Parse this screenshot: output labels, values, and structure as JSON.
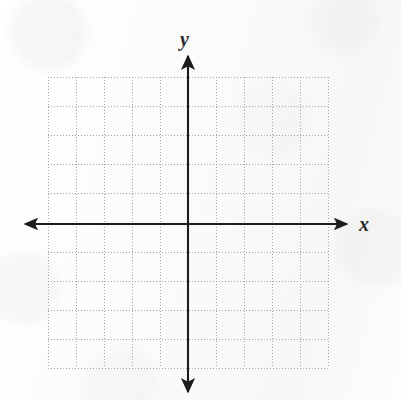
{
  "figure": {
    "background_color": "#fcfcfb"
  },
  "axes": {
    "x_label": "x",
    "y_label": "y",
    "axis_color": "#1c1c1c",
    "axis_line_width": 2,
    "x_axis": {
      "name": "x-axis",
      "y_position": 224,
      "start_x": 25,
      "end_x": 347,
      "arrowheads": [
        "left",
        "right"
      ]
    },
    "y_axis": {
      "name": "y-axis",
      "x_position": 188,
      "start_y": 56,
      "end_y": 392,
      "arrowheads": [
        "up",
        "down"
      ]
    }
  },
  "grid": {
    "style": "dotted",
    "color": "#8e8e8e",
    "left": 48,
    "top": 77,
    "right": 328,
    "bottom": 368,
    "cell_width": 28,
    "cell_height": 29.1,
    "columns": 10,
    "rows": 10,
    "columns_left_of_origin": 5,
    "columns_right_of_origin": 5,
    "rows_above_origin": 5,
    "rows_below_origin": 5,
    "tick_labels_shown": false
  },
  "chart_data": {
    "type": "scatter",
    "title": "",
    "subtitle": "",
    "xlabel": "x",
    "ylabel": "y",
    "xlim": [
      -5,
      5
    ],
    "ylim": [
      -5,
      5
    ],
    "xticks": [
      -5,
      -4,
      -3,
      -2,
      -1,
      0,
      1,
      2,
      3,
      4,
      5
    ],
    "yticks": [
      -5,
      -4,
      -3,
      -2,
      -1,
      0,
      1,
      2,
      3,
      4,
      5
    ],
    "xtick_labels": [
      "",
      "",
      "",
      "",
      "",
      "",
      "",
      "",
      "",
      "",
      ""
    ],
    "ytick_labels": [
      "",
      "",
      "",
      "",
      "",
      "",
      "",
      "",
      "",
      "",
      ""
    ],
    "grid": true,
    "grid_style": "dotted",
    "legend": null,
    "legend_position": "none",
    "series": [],
    "annotations": []
  }
}
